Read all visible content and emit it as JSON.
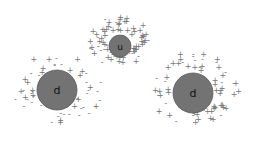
{
  "diagram": {
    "colors": {
      "quark_fill": "#737373",
      "quark_stroke": "#5a5a5a",
      "sea": "#777777",
      "background": "#ffffff"
    },
    "quarks": [
      {
        "id": "left-d",
        "label": "d",
        "cx": 57,
        "cy": 90,
        "r": 20
      },
      {
        "id": "top-u",
        "label": "u",
        "cx": 120,
        "cy": 46,
        "r": 11
      },
      {
        "id": "right-d",
        "label": "d",
        "cx": 193,
        "cy": 93,
        "r": 20
      }
    ],
    "sea_symbols": [
      "+",
      "-"
    ]
  }
}
